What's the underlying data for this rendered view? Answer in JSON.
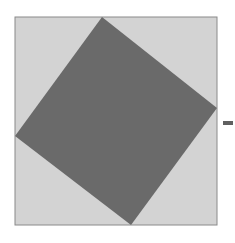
{
  "diagram": {
    "type": "geometric-figure",
    "colors": {
      "background": "#ffffff",
      "outer_fill": "#d3d3d3",
      "outer_stroke": "#8a8a8a",
      "inner_fill": "#6a6a6a",
      "dash": "#606060"
    },
    "outer_square": {
      "x": 15,
      "y": 17,
      "width": 202,
      "height": 208
    },
    "inner_square_points": "102,17 217,108 131,225 15,136",
    "dash": {
      "x": 223,
      "y": 121,
      "width": 10,
      "height": 4
    }
  }
}
